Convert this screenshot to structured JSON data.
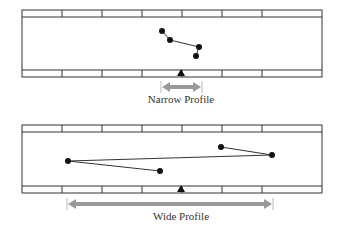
{
  "panels": [
    {
      "id": "narrow",
      "label": "Narrow Profile",
      "rect": {
        "x": 22,
        "y": 10,
        "w": 300,
        "h": 67
      },
      "strip_h": 7,
      "dividers": [
        62,
        102,
        142,
        182,
        222,
        262
      ],
      "path": [
        [
          162,
          31
        ],
        [
          170,
          40
        ],
        [
          199,
          47
        ],
        [
          196,
          56
        ]
      ],
      "triangle": [
        181,
        73
      ],
      "arrow": {
        "x1": 161,
        "x2": 202,
        "y": 87
      },
      "label_y": 103
    },
    {
      "id": "wide",
      "label": "Wide Profile",
      "rect": {
        "x": 22,
        "y": 125,
        "w": 300,
        "h": 68
      },
      "strip_h": 7,
      "dividers": [
        62,
        102,
        142,
        182,
        222,
        262
      ],
      "path": [
        [
          160,
          171
        ],
        [
          68,
          161
        ],
        [
          272,
          155
        ],
        [
          221,
          147
        ]
      ],
      "triangle": [
        181,
        189
      ],
      "arrow": {
        "x1": 67,
        "x2": 273,
        "y": 204
      },
      "label_y": 220
    }
  ],
  "colors": {
    "line": "#333333",
    "arrow": "#999999",
    "point": "#111111"
  }
}
